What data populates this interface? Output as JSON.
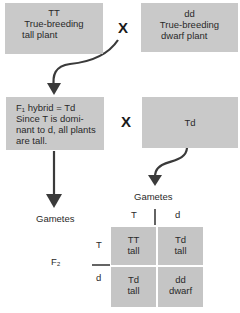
{
  "parents": {
    "left": {
      "genotype": "TT",
      "line1": "True-breeding",
      "line2": "tall plant"
    },
    "right": {
      "genotype": "dd",
      "line1": "True-breeding",
      "line2": "dwarf plant"
    },
    "cross_symbol": "X"
  },
  "f1": {
    "left": {
      "line1": "F₁ hybrid = Td",
      "line2": "Since T is domi-",
      "line3": "nant to d, all plants",
      "line4": "are tall."
    },
    "right": {
      "genotype": "Td"
    },
    "cross_symbol": "X"
  },
  "gametes": {
    "left_label": "Gametes",
    "right_label": "Gametes",
    "top_alleles": [
      "T",
      "d"
    ],
    "side_alleles": [
      "T",
      "d"
    ]
  },
  "f2": {
    "label": "F₂",
    "cells": [
      {
        "genotype": "TT",
        "phenotype": "tall"
      },
      {
        "genotype": "Td",
        "phenotype": "tall"
      },
      {
        "genotype": "Td",
        "phenotype": "tall"
      },
      {
        "genotype": "dd",
        "phenotype": "dwarf"
      }
    ]
  },
  "colors": {
    "box": "#c9c9c9",
    "arrow": "#3a3a3a",
    "background": "#ffffff"
  }
}
